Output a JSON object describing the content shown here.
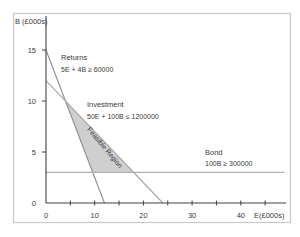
{
  "chart_data": {
    "type": "line",
    "title": "",
    "xlabel": "E(£000s)",
    "ylabel": "B (£000s)",
    "xlim": [
      0,
      49
    ],
    "ylim": [
      0,
      18
    ],
    "grid": false,
    "legend": "none (inline annotations)",
    "x_ticks": [
      0,
      5,
      10,
      15,
      20,
      25,
      30,
      35,
      40,
      45
    ],
    "x_tick_labels": [
      "0",
      "10",
      "20",
      "30",
      "40"
    ],
    "x_tick_label_values": [
      0,
      10,
      20,
      30,
      40
    ],
    "y_ticks": [
      0,
      5,
      10,
      15
    ],
    "y_tick_labels": [
      "0",
      "5",
      "10",
      "15"
    ],
    "series": [
      {
        "name": "Returns",
        "equation": "5E + 4B ≥ 60000",
        "points": [
          [
            0,
            15
          ],
          [
            12,
            0
          ]
        ],
        "color": "#8c8c8c"
      },
      {
        "name": "Investment",
        "equation": "50E + 100B ≤ 1200000",
        "points": [
          [
            0,
            12
          ],
          [
            24,
            0
          ]
        ],
        "color": "#a6a6a6"
      },
      {
        "name": "Bond",
        "equation": "100B ≥ 300000",
        "points": [
          [
            0,
            3
          ],
          [
            49,
            3
          ]
        ],
        "color": "#b0b0b0"
      }
    ],
    "feasible_region": {
      "label": "Feasible Region",
      "vertices": [
        [
          4,
          10
        ],
        [
          18,
          3
        ],
        [
          9.6,
          3
        ]
      ],
      "fill": "#cfcfcf"
    },
    "annotations": [
      {
        "text": "Returns",
        "x": 3.1,
        "y": 14.3
      },
      {
        "text": "5E + 4B ≥ 60000",
        "x": 3.1,
        "y": 13.1
      },
      {
        "text": "Investment",
        "x": 8.5,
        "y": 9.7
      },
      {
        "text": "50E + 100B ≤ 1200000",
        "x": 8.5,
        "y": 8.5
      },
      {
        "text": "Bond",
        "x": 32.7,
        "y": 4.9
      },
      {
        "text": "100B ≥ 300000",
        "x": 32.7,
        "y": 3.8
      }
    ]
  },
  "labels": {
    "y_axis": "B (£000s)",
    "x_axis": "E(£000s)",
    "returns_title": "Returns",
    "returns_eq": "5E + 4B ≥ 60000",
    "investment_title": "Investment",
    "investment_eq": "50E + 100B ≤ 1200000",
    "bond_title": "Bond",
    "bond_eq": "100B ≥ 300000",
    "feasible": "Feasible Region"
  },
  "colors": {
    "frame": "#c8c8c8",
    "axis": "#404040",
    "text": "#3a3a3a"
  }
}
